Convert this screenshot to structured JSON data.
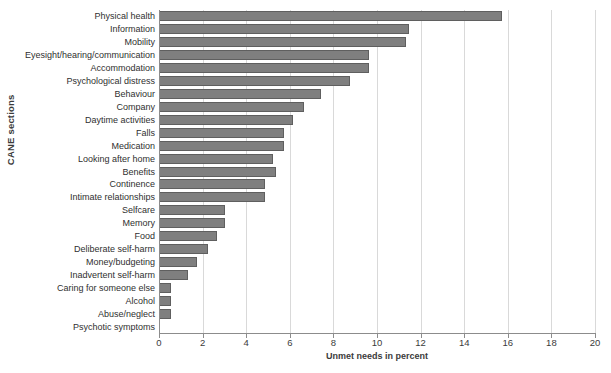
{
  "chart_data": {
    "type": "bar",
    "orientation": "horizontal",
    "title": "",
    "xlabel": "Unmet needs in percent",
    "ylabel": "CANE sections",
    "xlim": [
      0,
      20
    ],
    "xticks": [
      0,
      2,
      4,
      6,
      8,
      10,
      12,
      14,
      16,
      18,
      20
    ],
    "grid": true,
    "legend": false,
    "categories": [
      "Physical health",
      "Information",
      "Mobility",
      "Eyesight/hearing/communication",
      "Accommodation",
      "Psychological distress",
      "Behaviour",
      "Company",
      "Daytime activities",
      "Falls",
      "Medication",
      "Looking after home",
      "Benefits",
      "Continence",
      "Intimate relationships",
      "Selfcare",
      "Memory",
      "Food",
      "Deliberate self-harm",
      "Money/budgeting",
      "Inadvertent self-harm",
      "Caring for someone else",
      "Alcohol",
      "Abuse/neglect",
      "Psychotic symptoms"
    ],
    "values": [
      15.7,
      11.4,
      11.3,
      9.6,
      9.6,
      8.7,
      7.4,
      6.6,
      6.1,
      5.7,
      5.7,
      5.2,
      5.3,
      4.8,
      4.8,
      3.0,
      3.0,
      2.6,
      2.2,
      1.7,
      1.3,
      0.5,
      0.5,
      0.5,
      0
    ],
    "colors": {
      "bar_fill": "#7f7f7f",
      "bar_border": "#5f5f5f",
      "gridline": "#d9d9d9",
      "axis_line": "#8c8c8c",
      "text": "#2f2f2f"
    }
  }
}
